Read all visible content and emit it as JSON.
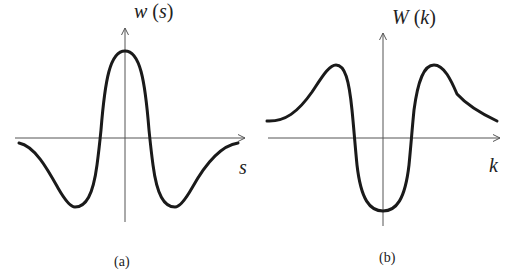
{
  "figure": {
    "panels": [
      {
        "id": "a",
        "y_label_fn": "w",
        "y_label_arg": "s",
        "x_label": "s",
        "caption": "(a)",
        "description": "Mexican-hat shaped function w(s): positive central peak, negative side lobes"
      },
      {
        "id": "b",
        "y_label_fn": "W",
        "y_label_arg": "k",
        "x_label": "k",
        "caption": "(b)",
        "description": "Fourier transform W(k): negative central trough, positive side peaks, decaying tails above zero"
      }
    ]
  },
  "colors": {
    "curve": "#1a1a1a",
    "axis": "#555555",
    "background": "#ffffff"
  }
}
